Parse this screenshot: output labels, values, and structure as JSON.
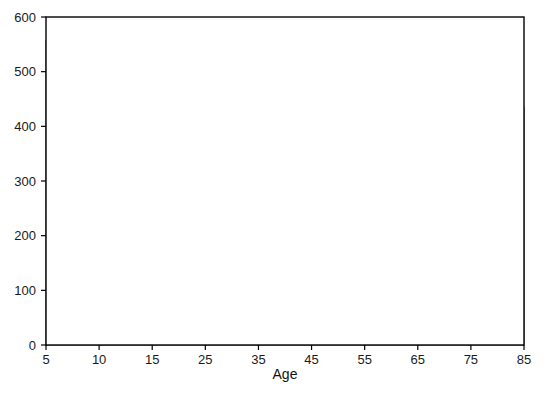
{
  "chart_data": {
    "type": "area",
    "title": "",
    "subtitle": "",
    "xlabel": "Age",
    "ylabel": "",
    "stacked": true,
    "grid": false,
    "legend_position": "inline-labels",
    "xlim": [
      5,
      85
    ],
    "ylim": [
      0,
      600
    ],
    "x_tick_labels": [
      "5",
      "10",
      "15",
      "25",
      "35",
      "45",
      "55",
      "65",
      "75",
      "85"
    ],
    "x": [
      5,
      10,
      15,
      25,
      35,
      45,
      55,
      65,
      75,
      85
    ],
    "y_tick_labels": [
      "0",
      "100",
      "200",
      "300",
      "400",
      "500",
      "600"
    ],
    "y_ticks": [
      0,
      100,
      200,
      300,
      400,
      500,
      600
    ],
    "stack_order_bottom_to_top": [
      "Stage 1",
      "Stage 2",
      "SWS",
      "REM",
      "WASO",
      "Sleeps Latency"
    ],
    "series": [
      {
        "name": "Stage 1",
        "color": "#a9a9a9",
        "label": "Stage 1",
        "values": [
          60,
          27,
          25,
          25,
          25,
          25,
          25,
          30,
          38,
          46
        ]
      },
      {
        "name": "Stage 2",
        "color": "#fafafa",
        "label": "Stage 2",
        "values": [
          177,
          212,
          214,
          212,
          210,
          208,
          202,
          205,
          192,
          180
        ]
      },
      {
        "name": "SWS",
        "color": "#000000",
        "label": "SWS",
        "values": [
          181,
          164,
          150,
          125,
          103,
          85,
          62,
          55,
          40,
          24
        ]
      },
      {
        "name": "REM",
        "color": "#b2b2b2",
        "label": "REM",
        "values": [
          108,
          102,
          98,
          92,
          88,
          82,
          78,
          76,
          74,
          72
        ]
      },
      {
        "name": "WASO",
        "color": "#f0f0f0",
        "label": "WASO",
        "values": [
          12,
          17,
          25,
          38,
          48,
          58,
          68,
          76,
          86,
          92
        ]
      },
      {
        "name": "Sleeps Latency",
        "color": "#767676",
        "label": "Sleeps Latency",
        "values": [
          20,
          20,
          22,
          22,
          22,
          22,
          22,
          22,
          22,
          22
        ]
      }
    ],
    "cumulative_tops": {
      "Stage 1": [
        60,
        27,
        25,
        25,
        25,
        25,
        25,
        30,
        38,
        46
      ],
      "Stage 2": [
        237,
        239,
        239,
        237,
        235,
        233,
        227,
        235,
        230,
        226
      ],
      "SWS": [
        418,
        403,
        389,
        362,
        338,
        318,
        289,
        290,
        270,
        250
      ],
      "REM": [
        526,
        505,
        487,
        454,
        426,
        400,
        367,
        366,
        344,
        322
      ],
      "WASO": [
        538,
        522,
        512,
        492,
        474,
        458,
        435,
        442,
        430,
        414
      ],
      "Sleeps Latency": [
        558,
        542,
        534,
        514,
        496,
        480,
        457,
        464,
        452,
        436
      ]
    },
    "inline_label_positions": [
      {
        "name": "Sleeps Latency",
        "x": 57,
        "y": 448
      },
      {
        "name": "WASO",
        "x": 56,
        "y": 410
      },
      {
        "name": "REM",
        "x": 52,
        "y": 345
      },
      {
        "name": "SWS",
        "x": 48,
        "y": 290
      },
      {
        "name": "Stage 2",
        "x": 45,
        "y": 128
      },
      {
        "name": "Stage 1",
        "x": 46,
        "y": 16
      }
    ]
  },
  "axis": {
    "x_title": "Age"
  }
}
